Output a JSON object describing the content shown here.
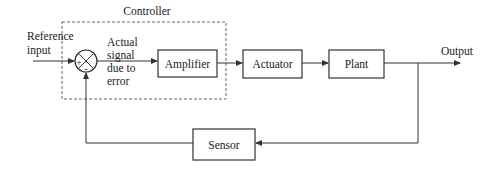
{
  "diagram": {
    "type": "closed-loop control system block diagram",
    "group": {
      "label": "Controller"
    },
    "input_label": {
      "line1": "Reference",
      "line2": "input"
    },
    "summing_junction": {
      "plus": "+",
      "minus": "-"
    },
    "error_label": {
      "line1": "Actual",
      "line2": "signal",
      "line3": "due to",
      "line4": "error"
    },
    "blocks": {
      "amplifier": "Amplifier",
      "actuator": "Actuator",
      "plant": "Plant",
      "sensor": "Sensor"
    },
    "output_label": "Output"
  }
}
